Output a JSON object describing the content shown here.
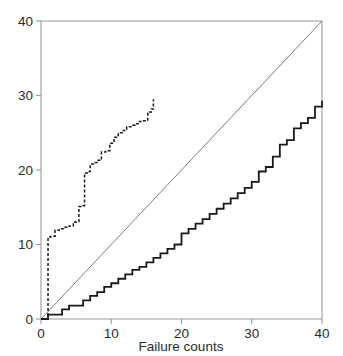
{
  "figure": {
    "width": 343,
    "height": 356,
    "background_color": "#ffffff"
  },
  "chart_data": {
    "type": "line",
    "title": "",
    "subtitle": "",
    "xlabel": "Failure counts",
    "ylabel": "",
    "xlim": [
      0,
      40
    ],
    "ylim": [
      0,
      40
    ],
    "xticks": [
      0,
      10,
      20,
      30,
      40
    ],
    "yticks": [
      0,
      10,
      20,
      30,
      40
    ],
    "xtick_labels": [
      "0",
      "10",
      "20",
      "30",
      "40"
    ],
    "ytick_labels": [
      "0",
      "10",
      "20",
      "30",
      "40"
    ],
    "grid": false,
    "legend": null,
    "legend_position": "none",
    "axis_color": "#9a9a9a",
    "tick_label_color": "#2b2b2b",
    "series": [
      {
        "name": "reference-diagonal",
        "style": "solid-thin",
        "color": "#6e6e6e",
        "line_width": 0.9,
        "drawstyle": "default",
        "x": [
          0,
          40
        ],
        "values": [
          0,
          40
        ]
      },
      {
        "name": "lower-step-curve",
        "style": "solid",
        "color": "#1a1a1a",
        "line_width": 1.8,
        "drawstyle": "steps-post",
        "x": [
          0,
          1,
          2,
          3,
          4,
          5,
          6,
          7,
          8,
          9,
          10,
          11,
          12,
          13,
          14,
          15,
          16,
          17,
          18,
          19,
          20,
          21,
          22,
          23,
          24,
          25,
          26,
          27,
          28,
          29,
          30,
          31,
          32,
          33,
          34,
          35,
          36,
          37,
          38,
          39,
          40
        ],
        "values": [
          0.0,
          0.6,
          0.6,
          1.3,
          1.8,
          1.8,
          2.5,
          3.1,
          3.6,
          4.3,
          4.8,
          5.4,
          6.0,
          6.6,
          7.0,
          7.6,
          8.2,
          8.8,
          9.4,
          10.0,
          11.5,
          12.1,
          12.8,
          13.4,
          14.1,
          14.8,
          15.5,
          16.2,
          16.9,
          17.6,
          18.4,
          19.8,
          20.4,
          21.8,
          23.4,
          24.0,
          25.6,
          26.3,
          27.0,
          28.5,
          29.3
        ]
      },
      {
        "name": "upper-step-curve",
        "style": "dashed",
        "color": "#1a1a1a",
        "line_width": 1.5,
        "dash_pattern": "3,2",
        "drawstyle": "steps-post",
        "x": [
          0,
          1,
          1.4,
          2,
          2.6,
          3.2,
          4,
          4.6,
          5,
          5.4,
          6,
          6.2,
          6.6,
          7,
          7.5,
          8,
          8.6,
          9.2,
          9.8,
          10.4,
          11,
          11.6,
          12.2,
          12.8,
          13.4,
          14,
          14.6,
          15.2,
          15.7,
          16
        ],
        "values": [
          0.0,
          11.0,
          11.1,
          11.9,
          12.1,
          12.3,
          12.5,
          13.0,
          13.1,
          15.1,
          15.2,
          19.6,
          19.8,
          20.8,
          21.0,
          21.3,
          22.4,
          22.6,
          23.6,
          24.4,
          25.0,
          25.3,
          25.8,
          26.0,
          26.2,
          26.5,
          26.6,
          27.8,
          28.2,
          29.5
        ]
      }
    ]
  }
}
